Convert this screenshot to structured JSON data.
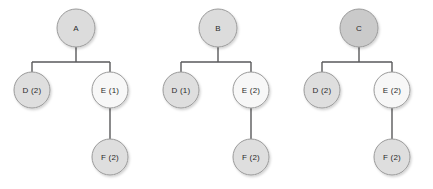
{
  "diagram": {
    "background_color": "#ffffff",
    "edge_color": "#59595b",
    "node_stroke_color": "#9a9a9a",
    "node_text_color": "#2b2b2b",
    "trees": [
      {
        "id": "tree-a",
        "root": {
          "label": "A",
          "fill": "#dcdcdc",
          "cx": 76,
          "cy": 28,
          "r": 19
        },
        "children": [
          {
            "label": "D (2)",
            "fill": "#dedede",
            "cx": 32,
            "cy": 90,
            "r": 18
          },
          {
            "label": "E (1)",
            "fill": "#f7f7f7",
            "cx": 110,
            "cy": 90,
            "r": 18
          }
        ],
        "grandchild": {
          "label": "F (2)",
          "fill": "#dedede",
          "cx": 110,
          "cy": 157,
          "r": 18
        }
      },
      {
        "id": "tree-b",
        "root": {
          "label": "B",
          "fill": "#dcdcdc",
          "cx": 218,
          "cy": 28,
          "r": 19
        },
        "children": [
          {
            "label": "D (1)",
            "fill": "#dedede",
            "cx": 181,
            "cy": 90,
            "r": 18
          },
          {
            "label": "E (2)",
            "fill": "#f7f7f7",
            "cx": 251,
            "cy": 90,
            "r": 18
          }
        ],
        "grandchild": {
          "label": "F (2)",
          "fill": "#dedede",
          "cx": 251,
          "cy": 157,
          "r": 18
        }
      },
      {
        "id": "tree-c",
        "root": {
          "label": "C",
          "fill": "#cacaca",
          "cx": 359,
          "cy": 28,
          "r": 19
        },
        "children": [
          {
            "label": "D (2)",
            "fill": "#dedede",
            "cx": 322,
            "cy": 90,
            "r": 18
          },
          {
            "label": "E (2)",
            "fill": "#f7f7f7",
            "cx": 392,
            "cy": 90,
            "r": 18
          }
        ],
        "grandchild": {
          "label": "F (2)",
          "fill": "#dedede",
          "cx": 392,
          "cy": 157,
          "r": 18
        }
      }
    ]
  }
}
